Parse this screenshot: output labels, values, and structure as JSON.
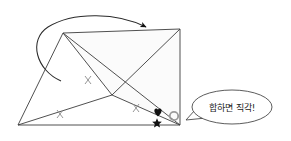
{
  "figure": {
    "type": "geometry-diagram",
    "background_color": "#ffffff",
    "stroke_color": "#3c3c3c",
    "fill_color": "#fbfbfb",
    "marker_color": "#888888",
    "symbol_color": "#111111"
  },
  "shape": {
    "name": "triangle",
    "vertices": {
      "apex": {
        "x": 63,
        "y": 33
      },
      "bottom_left": {
        "x": 18,
        "y": 125
      },
      "bottom_right": {
        "x": 180,
        "y": 125
      },
      "top_right": {
        "x": 180,
        "y": 29
      }
    }
  },
  "markers": {
    "tick_label": "×",
    "ticks": [
      {
        "name": "tick-left-base",
        "x": 60,
        "y": 114
      },
      {
        "name": "tick-mid-base",
        "x": 136,
        "y": 108
      },
      {
        "name": "tick-interior",
        "x": 88,
        "y": 80
      }
    ],
    "heart": {
      "symbol": "♥",
      "x": 158,
      "y": 113
    },
    "star": {
      "symbol": "★",
      "x": 157,
      "y": 123
    },
    "right_angle_circle": {
      "name": "right-angle-marker",
      "x": 174,
      "y": 116,
      "r": 4
    }
  },
  "annotation_arrow": {
    "name": "curved-rotation-arrow",
    "description": "curved arrow sweeping from lower-left up and over to the right"
  },
  "speech_bubble": {
    "text": "합하면 직각!",
    "center": {
      "x": 232,
      "y": 107
    },
    "rx": 40,
    "ry": 17
  }
}
